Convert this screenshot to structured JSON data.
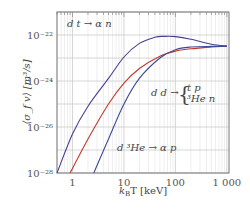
{
  "chart_data": {
    "type": "line",
    "title": "",
    "xlabel": "k_B T  [keV]",
    "ylabel": "⟨σ_f v⟩ [m³/s]",
    "xscale": "log",
    "yscale": "log",
    "xlim": [
      0.5,
      1100
    ],
    "ylim": [
      1e-28,
      1e-21
    ],
    "grid": true,
    "x_ticks": [
      "1",
      "10",
      "100",
      "1 000"
    ],
    "y_ticks": [
      "10⁻²²",
      "10⁻²⁴",
      "10⁻²⁶",
      "10⁻²⁸"
    ],
    "series": [
      {
        "name": "d t → α n",
        "color": "#4a3f8f",
        "x": [
          0.5,
          1,
          2,
          5,
          10,
          20,
          40,
          60,
          100,
          200,
          500,
          1000
        ],
        "y": [
          1e-28,
          5e-27,
          8e-26,
          1.3e-24,
          1.1e-23,
          4.3e-23,
          8e-23,
          8.7e-23,
          8.5e-23,
          6.5e-23,
          4e-23,
          3.3e-23
        ]
      },
      {
        "name": "d d → {t p, ³He n}",
        "color": "#c0392b",
        "x": [
          0.9,
          2,
          5,
          10,
          20,
          50,
          100,
          200,
          500,
          1000
        ],
        "y": [
          1e-28,
          3e-27,
          1e-25,
          8e-25,
          3.5e-24,
          1.2e-23,
          2e-23,
          2.5e-23,
          3e-23,
          3.3e-23
        ]
      },
      {
        "name": "d ³He → α p",
        "color": "#3b4a9a",
        "x": [
          2.6,
          5,
          10,
          20,
          50,
          100,
          200,
          500,
          1000
        ],
        "y": [
          1e-28,
          3e-27,
          1e-25,
          1.3e-24,
          1e-23,
          2.3e-23,
          3e-23,
          3.2e-23,
          3.2e-23
        ]
      }
    ],
    "annotations": [
      "d t → α n",
      "d d → { t p / ³He n }",
      "d ³He → α p"
    ]
  },
  "labels": {
    "dt": "d t → α n",
    "dd_prefix": "d d →",
    "dd_top": "t p",
    "dd_bot": "³He n",
    "dhe": "d ³He → α p",
    "xlabel_main": "k",
    "xlabel_sub": "B",
    "xlabel_rest": "T   [keV]",
    "ylabel": "⟨σ_f v⟩ [m³/s]"
  }
}
